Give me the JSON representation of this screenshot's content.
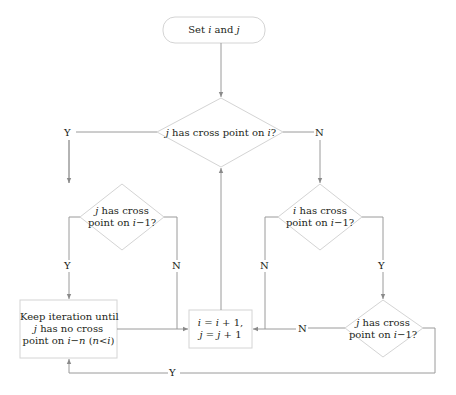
{
  "diagram": {
    "type": "flowchart",
    "nodes": {
      "start": {
        "shape": "rounded-rect",
        "pre": "Set ",
        "v1": "i",
        "mid": " and ",
        "v2": "j"
      },
      "main_decision": {
        "shape": "diamond",
        "v1": "j",
        "text": " has cross point on ",
        "v2": "i",
        "end": "?"
      },
      "left_decision": {
        "shape": "diamond",
        "line1_v": "j",
        "line1": " has cross",
        "line2": "point on ",
        "line2_v": "i",
        "line2_end": "−1?"
      },
      "right_decision": {
        "shape": "diamond",
        "line1_v": "i",
        "line1": " has cross",
        "line2": "point on ",
        "line2_v": "i",
        "line2_end": "−1?"
      },
      "keep_iteration": {
        "shape": "rect",
        "line1": "Keep iteration until",
        "line2_v": "j",
        "line2": " has no cross",
        "line3": "point on ",
        "line3_v": "i−n",
        "line3_paren_open": " (",
        "line3_paren_v": "n<i",
        "line3_paren_close": ")"
      },
      "increment": {
        "shape": "rect",
        "line1_a": "i",
        "line1_b": " = ",
        "line1_c": "i",
        "line1_d": " + 1,",
        "line2_a": "j",
        "line2_b": " = ",
        "line2_c": "j",
        "line2_d": " + 1"
      },
      "bottom_decision": {
        "shape": "diamond",
        "line1_v": "j",
        "line1": " has cross",
        "line2": "point on ",
        "line2_v": "i",
        "line2_end": "−1?"
      }
    },
    "edge_labels": {
      "main_yes": "Y",
      "main_no": "N",
      "left_yes": "Y",
      "left_no": "N",
      "right_no": "N",
      "right_yes": "Y",
      "bottom_no": "N",
      "bottom_yes": "Y"
    },
    "colors": {
      "line": "#9a9a9a",
      "shape_border": "#d4d4d4",
      "text": "#231f20"
    }
  }
}
